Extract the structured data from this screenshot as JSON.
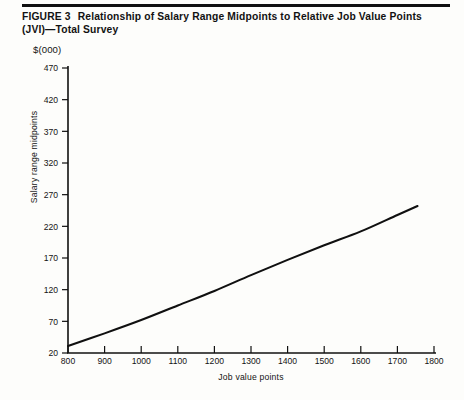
{
  "figure": {
    "label": "FIGURE 3",
    "caption": "Relationship of Salary Range Midpoints to Relative Job Value Points (JVI)—Total Survey"
  },
  "units_label": "$(000)",
  "chart_data": {
    "type": "line",
    "title": "Relationship of Salary Range Midpoints to Relative Job Value Points (JVI)—Total Survey",
    "xlabel": "Job value points",
    "ylabel": "Salary range midpoints",
    "units": "$(000)",
    "xlim": [
      800,
      1800
    ],
    "ylim": [
      20,
      470
    ],
    "xticks": [
      800,
      900,
      1000,
      1100,
      1200,
      1300,
      1400,
      1500,
      1600,
      1700,
      1800
    ],
    "yticks": [
      20,
      70,
      120,
      170,
      220,
      270,
      320,
      370,
      420,
      470
    ],
    "grid": false,
    "legend": null,
    "series": [
      {
        "name": "Salary range midpoint",
        "x": [
          800,
          900,
          1000,
          1100,
          1200,
          1300,
          1400,
          1500,
          1600,
          1700,
          1755
        ],
        "values": [
          31,
          51,
          72,
          95,
          118,
          143,
          167,
          190,
          212,
          238,
          252
        ]
      }
    ]
  }
}
